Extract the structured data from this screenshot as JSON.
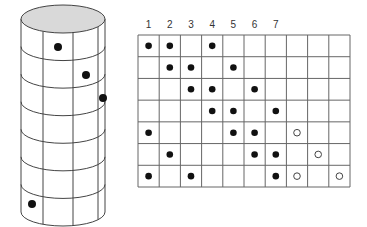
{
  "column_labels": [
    "1",
    "2",
    "3",
    "4",
    "5",
    "6",
    "7"
  ],
  "grid": {
    "cols": 10,
    "rows": 7,
    "filled_dots": [
      [
        0,
        0
      ],
      [
        0,
        1
      ],
      [
        0,
        3
      ],
      [
        1,
        1
      ],
      [
        1,
        2
      ],
      [
        1,
        4
      ],
      [
        2,
        2
      ],
      [
        2,
        3
      ],
      [
        2,
        5
      ],
      [
        3,
        3
      ],
      [
        3,
        4
      ],
      [
        3,
        6
      ],
      [
        4,
        0
      ],
      [
        4,
        4
      ],
      [
        4,
        5
      ],
      [
        5,
        1
      ],
      [
        5,
        5
      ],
      [
        5,
        6
      ],
      [
        6,
        0
      ],
      [
        6,
        2
      ],
      [
        6,
        6
      ]
    ],
    "open_dots": [
      [
        4,
        7
      ],
      [
        5,
        8
      ],
      [
        6,
        7
      ],
      [
        6,
        9
      ]
    ]
  },
  "cylinder": {
    "top_fill": "#d9d9d9",
    "rings": 7,
    "dots": [
      {
        "x": 58,
        "y": 47
      },
      {
        "x": 86,
        "y": 75
      },
      {
        "x": 103,
        "y": 98
      },
      {
        "x": 32,
        "y": 204
      }
    ]
  }
}
